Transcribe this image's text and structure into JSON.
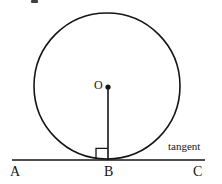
{
  "figure": {
    "type": "geometry-diagram",
    "background_color": "#ffffff",
    "stroke_color": "#151515",
    "labels": {
      "center": "O",
      "point_a": "A",
      "point_b": "B",
      "point_c": "C",
      "tangent": "tangent"
    },
    "geometry": {
      "circle": {
        "cx": 107,
        "cy": 86,
        "r": 73,
        "stroke_width": 1.6
      },
      "center_dot": {
        "cx": 108,
        "cy": 87,
        "r": 2.6
      },
      "radius_segment": {
        "x1": 108,
        "y1": 87,
        "x2": 108,
        "y2": 160,
        "stroke_width": 1.6
      },
      "tangent_line": {
        "x1": 12,
        "y1": 160,
        "x2": 205,
        "y2": 160,
        "stroke_width": 1.6
      },
      "right_angle_marker": {
        "x": 96,
        "y": 148,
        "size": 11,
        "stroke_width": 1.3,
        "side": "left-of-radius"
      }
    }
  }
}
